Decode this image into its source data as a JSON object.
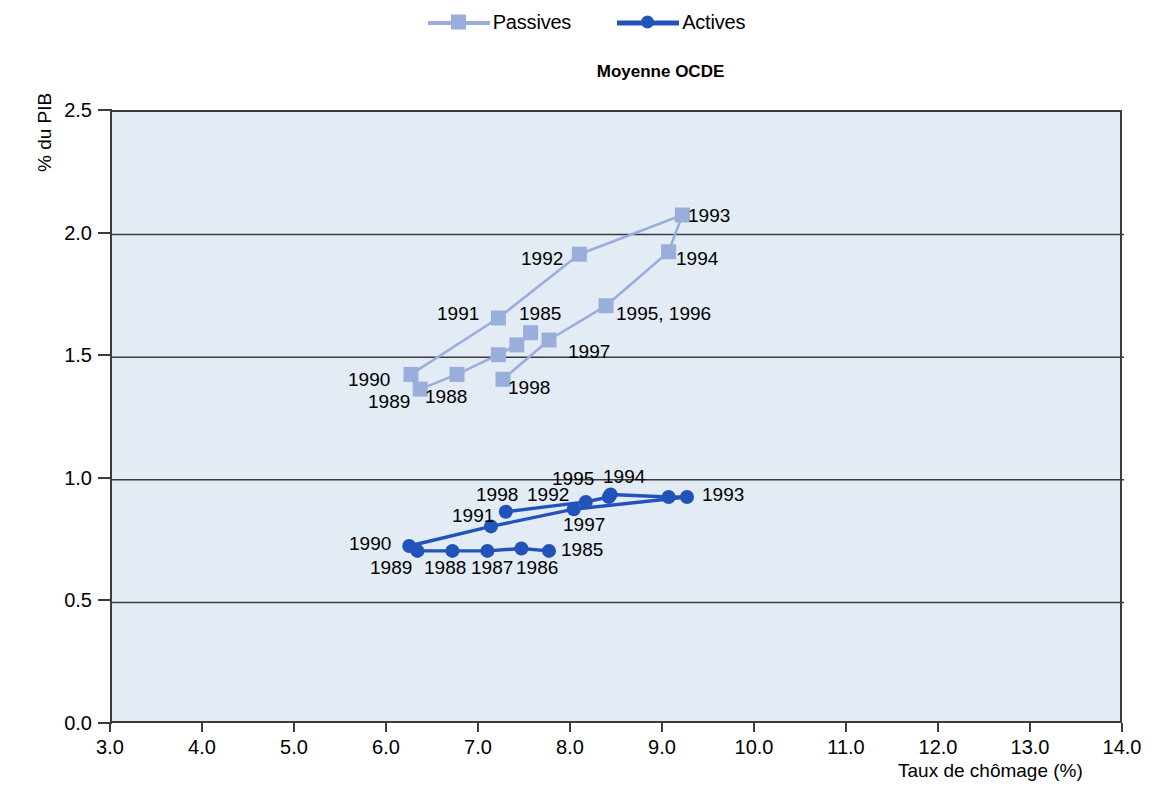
{
  "legend": {
    "items": [
      {
        "label": "Passives",
        "color": "#9aaedc",
        "marker": "square"
      },
      {
        "label": "Actives",
        "color": "#2253bb",
        "marker": "circle"
      }
    ]
  },
  "chart_data": {
    "type": "scatter",
    "title": "Moyenne OCDE",
    "xlabel": "Taux de chômage (%)",
    "ylabel": "% du PIB",
    "xlim": [
      3.0,
      14.0
    ],
    "ylim": [
      0.0,
      2.5
    ],
    "xticks": [
      "3.0",
      "4.0",
      "5.0",
      "6.0",
      "7.0",
      "8.0",
      "9.0",
      "10.0",
      "11.0",
      "12.0",
      "13.0",
      "14.0"
    ],
    "yticks": [
      "0.0",
      "0.5",
      "1.0",
      "1.5",
      "2.0",
      "2.5"
    ],
    "grid": "horizontal",
    "legend_position": "top-center",
    "connected": "by year order",
    "series": [
      {
        "name": "Passives",
        "color": "#9aaedc",
        "marker": "square",
        "points": [
          {
            "label": "1985",
            "x": 7.55,
            "y": 1.6,
            "label_pos": "above-left"
          },
          {
            "label": "1986",
            "x": 7.4,
            "y": 1.55,
            "label_pos": "none"
          },
          {
            "label": "1987",
            "x": 7.2,
            "y": 1.51,
            "label_pos": "none"
          },
          {
            "label": "1988",
            "x": 6.75,
            "y": 1.43,
            "label_pos": "below-right"
          },
          {
            "label": "1989",
            "x": 6.35,
            "y": 1.37,
            "label_pos": "below"
          },
          {
            "label": "1990",
            "x": 6.25,
            "y": 1.43,
            "label_pos": "left"
          },
          {
            "label": "1991",
            "x": 7.2,
            "y": 1.66,
            "label_pos": "left"
          },
          {
            "label": "1992",
            "x": 8.08,
            "y": 1.92,
            "label_pos": "left"
          },
          {
            "label": "1993",
            "x": 9.2,
            "y": 2.08,
            "label_pos": "right"
          },
          {
            "label": "1994",
            "x": 9.05,
            "y": 1.93,
            "label_pos": "right"
          },
          {
            "label": "1995, 1996",
            "x": 8.37,
            "y": 1.71,
            "label_pos": "right"
          },
          {
            "label": "1997",
            "x": 7.75,
            "y": 1.57,
            "label_pos": "right"
          },
          {
            "label": "1998",
            "x": 7.25,
            "y": 1.41,
            "label_pos": "right"
          }
        ]
      },
      {
        "name": "Actives",
        "color": "#2253bb",
        "marker": "circle",
        "points": [
          {
            "label": "1985",
            "x": 7.75,
            "y": 0.71,
            "label_pos": "right"
          },
          {
            "label": "1986",
            "x": 7.45,
            "y": 0.72,
            "label_pos": "below"
          },
          {
            "label": "1987",
            "x": 7.08,
            "y": 0.71,
            "label_pos": "below"
          },
          {
            "label": "1988",
            "x": 6.7,
            "y": 0.71,
            "label_pos": "below"
          },
          {
            "label": "1989",
            "x": 6.32,
            "y": 0.71,
            "label_pos": "below"
          },
          {
            "label": "1990",
            "x": 6.23,
            "y": 0.73,
            "label_pos": "left"
          },
          {
            "label": "1991",
            "x": 7.12,
            "y": 0.81,
            "label_pos": "left"
          },
          {
            "label": "1992",
            "x": 8.02,
            "y": 0.88,
            "label_pos": "above"
          },
          {
            "label": "1993",
            "x": 9.25,
            "y": 0.93,
            "label_pos": "right"
          },
          {
            "label": "1994",
            "x": 9.05,
            "y": 0.93,
            "label_pos": "above"
          },
          {
            "label": "1995",
            "x": 8.42,
            "y": 0.94,
            "label_pos": "above"
          },
          {
            "label": "1996",
            "x": 8.4,
            "y": 0.93,
            "label_pos": "none"
          },
          {
            "label": "1997",
            "x": 8.15,
            "y": 0.91,
            "label_pos": "below-right"
          },
          {
            "label": "1998",
            "x": 7.28,
            "y": 0.87,
            "label_pos": "above"
          }
        ]
      }
    ]
  },
  "annotations": {
    "passives": [
      {
        "text": "1993",
        "x": 688,
        "y": 205
      },
      {
        "text": "1994",
        "x": 676,
        "y": 248
      },
      {
        "text": "1992",
        "x": 521,
        "y": 248
      },
      {
        "text": "1995, 1996",
        "x": 616,
        "y": 303
      },
      {
        "text": "1991",
        "x": 437,
        "y": 303
      },
      {
        "text": "1985",
        "x": 519,
        "y": 303
      },
      {
        "text": "1997",
        "x": 568,
        "y": 341
      },
      {
        "text": "1990",
        "x": 348,
        "y": 369
      },
      {
        "text": "1998",
        "x": 508,
        "y": 377
      },
      {
        "text": "1989",
        "x": 368,
        "y": 391
      },
      {
        "text": "1988",
        "x": 425,
        "y": 386
      }
    ],
    "actives": [
      {
        "text": "1995",
        "x": 552,
        "y": 468
      },
      {
        "text": "1994",
        "x": 603,
        "y": 466
      },
      {
        "text": "1993",
        "x": 702,
        "y": 484
      },
      {
        "text": "1998",
        "x": 476,
        "y": 484
      },
      {
        "text": "1992",
        "x": 527,
        "y": 484
      },
      {
        "text": "1991",
        "x": 452,
        "y": 505
      },
      {
        "text": "1997",
        "x": 563,
        "y": 514
      },
      {
        "text": "1990",
        "x": 349,
        "y": 533
      },
      {
        "text": "1989",
        "x": 370,
        "y": 557
      },
      {
        "text": "1988",
        "x": 424,
        "y": 557
      },
      {
        "text": "1987",
        "x": 471,
        "y": 557
      },
      {
        "text": "1986",
        "x": 516,
        "y": 557
      },
      {
        "text": "1985",
        "x": 561,
        "y": 539
      }
    ]
  }
}
